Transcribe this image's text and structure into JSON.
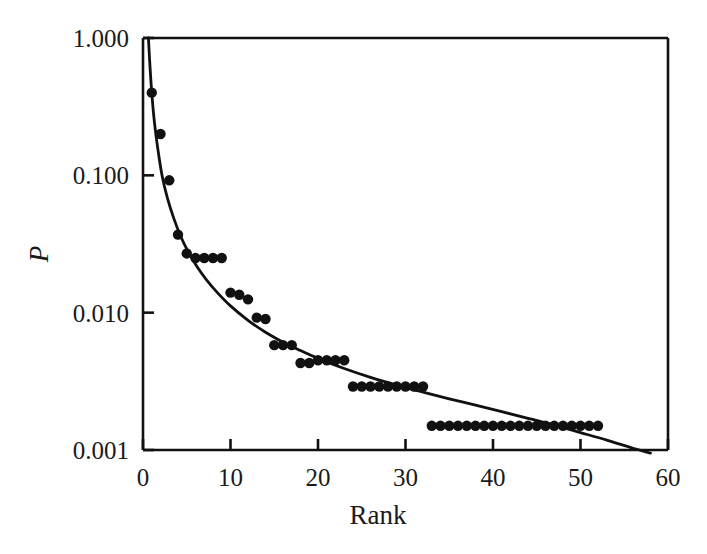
{
  "chart_data": {
    "type": "scatter",
    "title": "",
    "subtitle": "",
    "xlabel": "Rank",
    "ylabel": "P",
    "yscale": "log",
    "xscale": "linear",
    "xlim": [
      0,
      60
    ],
    "ylim": [
      0.001,
      1.0
    ],
    "grid": false,
    "legend": null,
    "xticks": [
      0,
      10,
      20,
      30,
      40,
      50,
      60
    ],
    "xtick_labels": [
      "0",
      "10",
      "20",
      "30",
      "40",
      "50",
      "60"
    ],
    "yticks": [
      0.001,
      0.01,
      0.1,
      1.0
    ],
    "ytick_labels": [
      "0.001",
      "0.010",
      "0.100",
      "1.000"
    ],
    "marker": "filled-circle",
    "marker_color": "#111111",
    "line_color": "#111111",
    "series": [
      {
        "name": "observed",
        "type": "scatter",
        "x": [
          1,
          2,
          3,
          4,
          5,
          6,
          7,
          8,
          9,
          10,
          11,
          12,
          13,
          14,
          15,
          16,
          17,
          18,
          19,
          20,
          21,
          22,
          23,
          24,
          25,
          26,
          27,
          28,
          29,
          30,
          31,
          32,
          33,
          34,
          35,
          36,
          37,
          38,
          39,
          40,
          41,
          42,
          43,
          44,
          45,
          46,
          47,
          48,
          49,
          50,
          51,
          52
        ],
        "y": [
          0.4,
          0.2,
          0.092,
          0.037,
          0.027,
          0.025,
          0.025,
          0.025,
          0.025,
          0.014,
          0.0135,
          0.0125,
          0.0092,
          0.009,
          0.0058,
          0.0058,
          0.0058,
          0.0043,
          0.0043,
          0.0045,
          0.0045,
          0.0045,
          0.0045,
          0.0029,
          0.0029,
          0.0029,
          0.0029,
          0.0029,
          0.0029,
          0.0029,
          0.0029,
          0.0029,
          0.0015,
          0.0015,
          0.0015,
          0.0015,
          0.0015,
          0.0015,
          0.0015,
          0.0015,
          0.0015,
          0.0015,
          0.0015,
          0.0015,
          0.0015,
          0.0015,
          0.0015,
          0.0015,
          0.0015,
          0.0015,
          0.0015,
          0.0015
        ]
      },
      {
        "name": "fit-curve",
        "type": "line",
        "x": [
          0.62,
          0.8,
          1,
          1.3,
          1.7,
          2.2,
          2.8,
          3.5,
          4.3,
          5.2,
          6.2,
          7.3,
          8.5,
          10,
          12,
          14,
          16,
          18,
          20,
          23,
          26,
          29,
          32,
          35,
          38,
          41,
          44,
          47,
          50,
          53,
          56,
          58
        ],
        "y": [
          1.0,
          0.62,
          0.4,
          0.245,
          0.155,
          0.098,
          0.068,
          0.049,
          0.036,
          0.0275,
          0.0215,
          0.0172,
          0.014,
          0.0112,
          0.0088,
          0.0072,
          0.0061,
          0.0053,
          0.00465,
          0.00392,
          0.00338,
          0.00297,
          0.00264,
          0.00236,
          0.00212,
          0.0019,
          0.0017,
          0.00152,
          0.00134,
          0.00118,
          0.00103,
          0.00095
        ]
      }
    ]
  },
  "axes": {
    "frame_color": "#111111",
    "x_title": "Rank",
    "y_title": "P"
  }
}
